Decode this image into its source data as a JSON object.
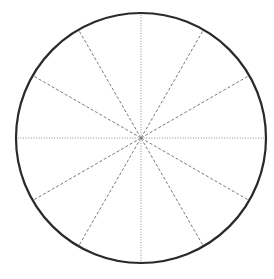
{
  "diagram": {
    "type": "circle-divided-into-sectors",
    "sectors": 12,
    "angle_step_deg": 30,
    "center": [
      141,
      138
    ],
    "radius": 125,
    "colors": {
      "background": "#ffffff",
      "circle_stroke": "#2a2a2a",
      "axis_lines": "#8a8a8a",
      "diagonal_lines": "#7a7a7a"
    },
    "line_styles": {
      "axis": "dotted",
      "diagonal": "dashed"
    }
  }
}
